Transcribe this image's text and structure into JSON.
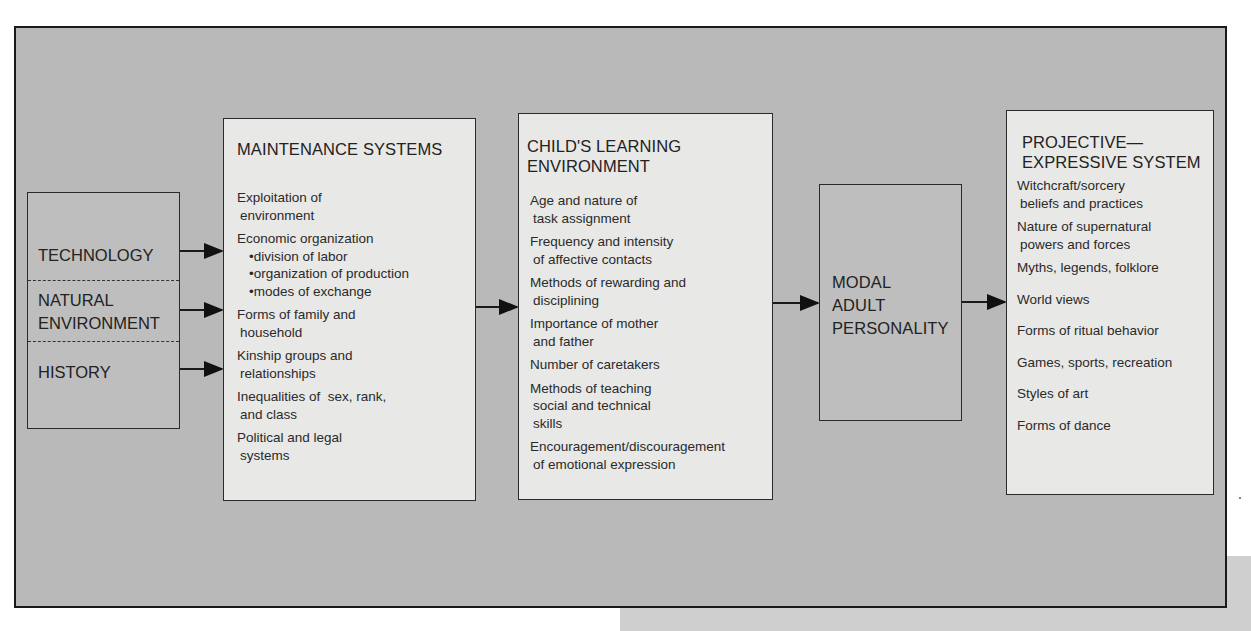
{
  "diagram": {
    "type": "flow",
    "inputs": {
      "sections": [
        {
          "label_lines": [
            "TECHNOLOGY"
          ]
        },
        {
          "label_lines": [
            "NATURAL",
            "ENVIRONMENT"
          ]
        },
        {
          "label_lines": [
            "HISTORY"
          ]
        }
      ]
    },
    "maintenance": {
      "title": "MAINTENANCE SYSTEMS",
      "items": [
        {
          "lines": [
            "Exploitation of",
            "environment"
          ]
        },
        {
          "lines": [
            "Economic organization"
          ],
          "subitems": [
            "•division of labor",
            "•organization of production",
            "•modes of exchange"
          ]
        },
        {
          "lines": [
            "Forms of family and",
            "household"
          ]
        },
        {
          "lines": [
            "Kinship groups and",
            "relationships"
          ]
        },
        {
          "lines": [
            "Inequalities of  sex, rank,",
            "and class"
          ]
        },
        {
          "lines": [
            "Political and legal",
            "systems"
          ]
        }
      ]
    },
    "child": {
      "title_lines": [
        "CHILD'S LEARNING",
        "ENVIRONMENT"
      ],
      "items": [
        {
          "lines": [
            "Age and nature of",
            "task assignment"
          ]
        },
        {
          "lines": [
            "Frequency and intensity",
            "of affective contacts"
          ]
        },
        {
          "lines": [
            "Methods of rewarding and",
            "disciplining"
          ]
        },
        {
          "lines": [
            "Importance of mother",
            "and father"
          ]
        },
        {
          "lines": [
            "Number of caretakers"
          ]
        },
        {
          "lines": [
            "Methods of teaching",
            "social and technical",
            "skills"
          ]
        },
        {
          "lines": [
            "Encouragement/discouragement",
            "of emotional expression"
          ]
        }
      ]
    },
    "modal": {
      "title_lines": [
        "MODAL",
        "ADULT",
        "PERSONALITY"
      ]
    },
    "projective": {
      "title_lines": [
        "PROJECTIVE—",
        "EXPRESSIVE SYSTEM"
      ],
      "items": [
        {
          "lines": [
            "Witchcraft/sorcery",
            "beliefs and practices"
          ]
        },
        {
          "lines": [
            "Nature of supernatural",
            "powers and forces"
          ]
        },
        {
          "lines": [
            "Myths, legends, folklore"
          ]
        },
        {
          "lines": [
            "World views"
          ]
        },
        {
          "lines": [
            "Forms of ritual behavior"
          ]
        },
        {
          "lines": [
            "Games, sports, recreation"
          ]
        },
        {
          "lines": [
            "Styles of art"
          ]
        },
        {
          "lines": [
            "Forms of dance"
          ]
        }
      ]
    },
    "colors": {
      "background": "#b9b9b9",
      "box_light": "#e8e8e6",
      "box_mid": "#bebebe",
      "border": "#1a1a1a"
    }
  }
}
